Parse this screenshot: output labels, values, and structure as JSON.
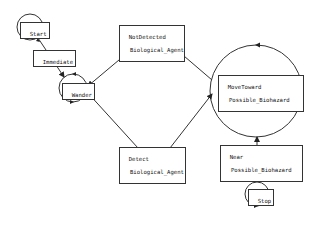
{
  "diagram": {
    "type": "state-machine",
    "colors": {
      "stroke": "#333333",
      "background": "#ffffff",
      "text": "#111111"
    },
    "states": [
      {
        "id": "start",
        "label": "Start"
      },
      {
        "id": "wander",
        "label": "Wander"
      },
      {
        "id": "move_toward",
        "label_line1": "MoveToward",
        "label_line2": "Possible_Biohazard"
      },
      {
        "id": "stop",
        "label": "Stop"
      }
    ],
    "transitions": [
      {
        "id": "immediate",
        "from": "start",
        "to": "wander",
        "label": "Immediate"
      },
      {
        "id": "not_detected",
        "from": "move_toward",
        "to": "wander",
        "label_line1": "NotDetected",
        "label_line2": "Biological_Agent"
      },
      {
        "id": "detect",
        "from": "wander",
        "to": "move_toward",
        "label_line1": "Detect",
        "label_line2": "Biological_Agent"
      },
      {
        "id": "near",
        "from": "move_toward",
        "to": "stop",
        "label_line1": "Near",
        "label_line2": "Possible_Biohazard"
      }
    ]
  }
}
